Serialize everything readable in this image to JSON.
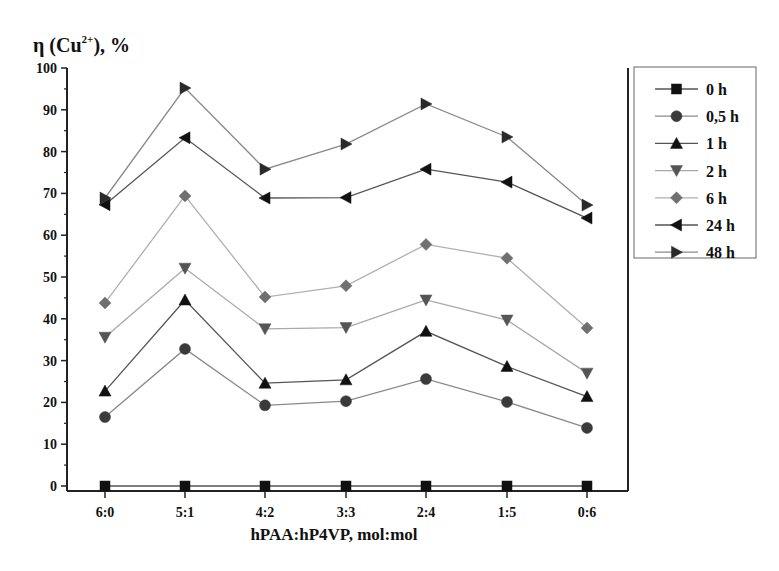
{
  "chart_data": {
    "type": "line",
    "title": "",
    "ylabel": "η (Cu2+), %",
    "ylabel_parts": {
      "base": "η (Cu",
      "sup": "2+",
      "tail": "), %"
    },
    "xlabel": "hPAA:hP4VP, mol:mol",
    "categories": [
      "6:0",
      "5:1",
      "4:2",
      "3:3",
      "2:4",
      "1:5",
      "0:6"
    ],
    "ylim": [
      0,
      100
    ],
    "yticks": [
      0,
      10,
      20,
      30,
      40,
      50,
      60,
      70,
      80,
      90,
      100
    ],
    "grid": false,
    "legend_position": "right-outside",
    "series": [
      {
        "name": "0 h",
        "marker": "square",
        "color": "#111111",
        "line_color": "#555555",
        "values": [
          0,
          0,
          0,
          0,
          0,
          0,
          0
        ]
      },
      {
        "name": "0,5 h",
        "marker": "circle",
        "color": "#3a3a3a",
        "line_color": "#8a8a8a",
        "values": [
          16.5,
          32.8,
          19.3,
          20.3,
          25.6,
          20.1,
          13.9
        ]
      },
      {
        "name": "1 h",
        "marker": "triangle-up",
        "color": "#111111",
        "line_color": "#555555",
        "values": [
          22.7,
          44.5,
          24.6,
          25.4,
          37.0,
          28.6,
          21.4
        ]
      },
      {
        "name": "2 h",
        "marker": "triangle-down",
        "color": "#555555",
        "line_color": "#a8a8a8",
        "values": [
          35.6,
          52.1,
          37.6,
          37.9,
          44.5,
          39.7,
          27.0
        ]
      },
      {
        "name": "6 h",
        "marker": "diamond",
        "color": "#707070",
        "line_color": "#b0b0b0",
        "values": [
          43.8,
          69.4,
          45.2,
          47.9,
          57.8,
          54.5,
          37.8
        ]
      },
      {
        "name": "24 h",
        "marker": "triangle-left",
        "color": "#111111",
        "line_color": "#555555",
        "values": [
          67.3,
          83.3,
          68.9,
          69.0,
          75.8,
          72.7,
          64.1
        ]
      },
      {
        "name": "48 h",
        "marker": "triangle-right",
        "color": "#2a2a2a",
        "line_color": "#8a8a8a",
        "values": [
          68.9,
          95.2,
          75.8,
          81.8,
          91.4,
          83.5,
          67.2
        ]
      }
    ]
  },
  "layout": {
    "plot": {
      "x0": 67,
      "x1": 628,
      "y_zero": 486,
      "y_top": 68,
      "axis_bottom": 491
    },
    "x_positions": [
      105,
      185,
      265,
      346,
      426,
      507,
      587
    ],
    "legend": {
      "x": 634,
      "y": 67,
      "w": 122,
      "h": 191
    }
  }
}
